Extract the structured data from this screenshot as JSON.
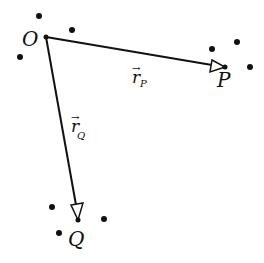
{
  "diagram": {
    "points": {
      "O": {
        "label": "O",
        "x": 46,
        "y": 37
      },
      "P": {
        "label": "P",
        "x": 225,
        "y": 67
      },
      "Q": {
        "label": "Q",
        "x": 78,
        "y": 220
      }
    },
    "vectors": [
      {
        "name": "r_P",
        "symbol": "r",
        "subscript": "P",
        "from": "O",
        "to": "P"
      },
      {
        "name": "r_Q",
        "symbol": "r",
        "subscript": "Q",
        "from": "O",
        "to": "Q"
      }
    ],
    "labels": {
      "O": "O",
      "P": "P",
      "Q": "Q",
      "rP_symbol": "r",
      "rP_sub": "P",
      "rQ_symbol": "r",
      "rQ_sub": "Q"
    },
    "colors": {
      "stroke": "#111111",
      "background": "#ffffff"
    }
  }
}
